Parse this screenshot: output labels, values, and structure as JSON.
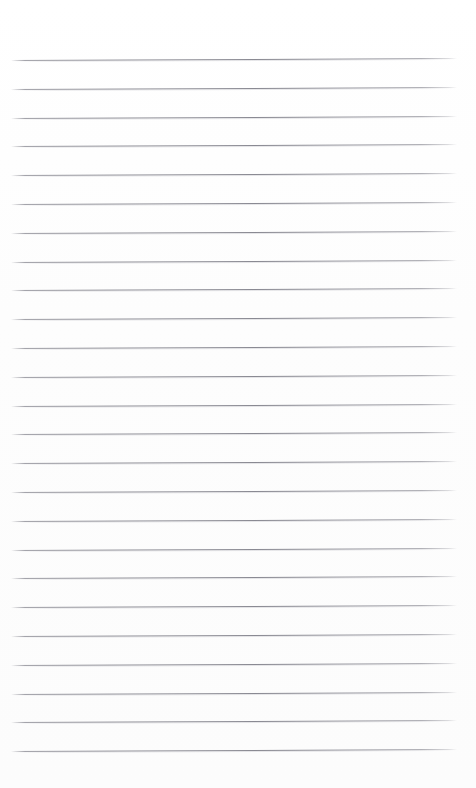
{
  "document": {
    "kind": "lined-notebook-paper",
    "title": "Blank Lined Paper",
    "page_width": 476,
    "page_height": 788,
    "background_color": "#fefefe",
    "body_text": "",
    "header_text": "",
    "footer_text": "",
    "page_number": ""
  },
  "ruling": {
    "line_color": "#8c8c94",
    "line_count": 25,
    "first_line_y": 60,
    "line_spacing": 28.75,
    "line_left_x": 11,
    "line_right_x": 457,
    "line_thickness": 1,
    "skew_degrees": -0.25,
    "margin_line_visible": false,
    "top_margin": 60,
    "bottom_margin": 38
  },
  "lines": [
    {
      "index": 1,
      "y": 60,
      "text": ""
    },
    {
      "index": 2,
      "y": 89,
      "text": ""
    },
    {
      "index": 3,
      "y": 118,
      "text": ""
    },
    {
      "index": 4,
      "y": 146,
      "text": ""
    },
    {
      "index": 5,
      "y": 175,
      "text": ""
    },
    {
      "index": 6,
      "y": 204,
      "text": ""
    },
    {
      "index": 7,
      "y": 233,
      "text": ""
    },
    {
      "index": 8,
      "y": 262,
      "text": ""
    },
    {
      "index": 9,
      "y": 290,
      "text": ""
    },
    {
      "index": 10,
      "y": 319,
      "text": ""
    },
    {
      "index": 11,
      "y": 348,
      "text": ""
    },
    {
      "index": 12,
      "y": 377,
      "text": ""
    },
    {
      "index": 13,
      "y": 406,
      "text": ""
    },
    {
      "index": 14,
      "y": 434,
      "text": ""
    },
    {
      "index": 15,
      "y": 463,
      "text": ""
    },
    {
      "index": 16,
      "y": 492,
      "text": ""
    },
    {
      "index": 17,
      "y": 521,
      "text": ""
    },
    {
      "index": 18,
      "y": 550,
      "text": ""
    },
    {
      "index": 19,
      "y": 578,
      "text": ""
    },
    {
      "index": 20,
      "y": 607,
      "text": ""
    },
    {
      "index": 21,
      "y": 636,
      "text": ""
    },
    {
      "index": 22,
      "y": 665,
      "text": ""
    },
    {
      "index": 23,
      "y": 694,
      "text": ""
    },
    {
      "index": 24,
      "y": 722,
      "text": ""
    },
    {
      "index": 25,
      "y": 751,
      "text": ""
    }
  ]
}
